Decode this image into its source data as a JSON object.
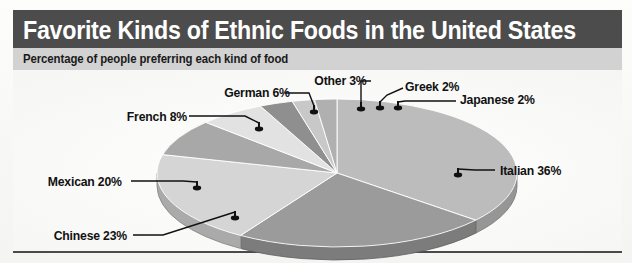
{
  "figure": {
    "title": "Favorite Kinds of Ethnic Foods in the United States",
    "subtitle": "Percentage of people preferring each kind of food",
    "watermark_line1": "LISTENING",
    "watermark_line2": "LISTENING"
  },
  "colors": {
    "title_bar": "#4c4c4c",
    "subtitle_bar": "#d2d2d2",
    "title_text": "#ffffff",
    "label_text": "#111111",
    "leader_line": "#111111",
    "plot_background": "#fafaf8"
  },
  "chart_data": {
    "type": "pie",
    "title": "Favorite Kinds of Ethnic Foods in the United States",
    "subtitle": "Percentage of people preferring each kind of food",
    "unit": "percent",
    "three_d": true,
    "start_angle_deg": -90,
    "direction": "clockwise",
    "total": 100,
    "categories": [
      "Italian",
      "Chinese",
      "Mexican",
      "French",
      "German",
      "Other",
      "Greek",
      "Japanese"
    ],
    "values": [
      36,
      23,
      20,
      8,
      6,
      3,
      2,
      2
    ],
    "labels": [
      "Italian 36%",
      "Chinese 23%",
      "Mexican 20%",
      "French 8%",
      "German 6%",
      "Other 3%",
      "Greek 2%",
      "Japanese 2%"
    ],
    "slice_colors": [
      "#bcbcbc",
      "#9b9b9b",
      "#d5d5d5",
      "#a8a8a8",
      "#e2e2e2",
      "#8f8f8f",
      "#c8c8c8",
      "#b0b0b0"
    ],
    "legend": "none",
    "grid": false
  },
  "labels": [
    {
      "name": "italian",
      "text": "Italian 36%",
      "side": "right",
      "x": 487,
      "y": 100
    },
    {
      "name": "chinese",
      "text": "Chinese 23%",
      "side": "left",
      "x": 138,
      "y": 165
    },
    {
      "name": "mexican",
      "text": "Mexican 20%",
      "side": "left",
      "x": 128,
      "y": 110
    },
    {
      "name": "french",
      "text": "French 8%",
      "side": "left",
      "x": 182,
      "y": 45
    },
    {
      "name": "german",
      "text": "German 6%",
      "side": "left",
      "x": 282,
      "y": 22
    },
    {
      "name": "other",
      "text": "Other 3%",
      "side": "left",
      "x": 368,
      "y": 8
    },
    {
      "name": "greek",
      "text": "Greek 2%",
      "side": "right",
      "x": 399,
      "y": 16
    },
    {
      "name": "japanese",
      "text": "Japanese 2%",
      "side": "right",
      "x": 453,
      "y": 29
    }
  ]
}
